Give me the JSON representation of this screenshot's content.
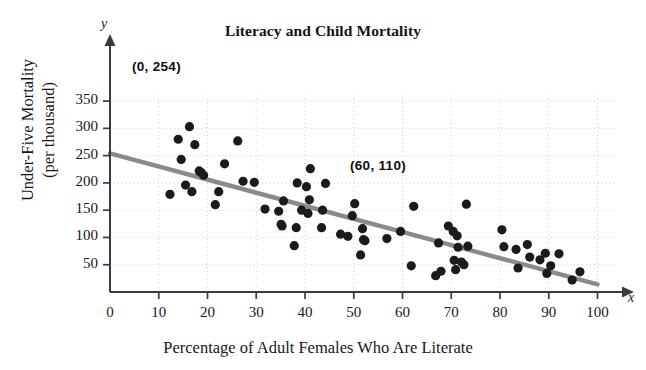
{
  "figure": {
    "top_partial_text": "",
    "x_axis_letter": "x",
    "y_axis_letter": "y"
  },
  "chart_data": {
    "type": "scatter",
    "title": "Literacy and Child Mortality",
    "xlabel": "Percentage of Adult Females Who Are Literate",
    "ylabel": "Under-Five Mortality",
    "ylabel_line2": "(per thousand)",
    "xlim": [
      0,
      104
    ],
    "ylim": [
      0,
      375
    ],
    "xticks": [
      0,
      10,
      20,
      30,
      40,
      50,
      60,
      70,
      80,
      90,
      100
    ],
    "yticks": [
      50,
      100,
      150,
      200,
      250,
      300,
      350
    ],
    "grid": true,
    "grid_style": "dotted",
    "legend": null,
    "colors": {
      "point": "#1a1a1f",
      "trendline": "#8a8a8e",
      "axis": "#3a3a40",
      "grid": "#c9c9cf",
      "text": "#17171b"
    },
    "point_radius": 4.6,
    "trendline": {
      "label": "least-squares line",
      "points": [
        [
          0,
          254
        ],
        [
          100,
          14
        ]
      ],
      "slope": -2.4,
      "intercept": 254,
      "annotated_points": [
        {
          "label": "(0, 254)",
          "x": 0,
          "y": 254
        },
        {
          "label": "(60, 110)",
          "x": 60,
          "y": 110
        }
      ]
    },
    "points": [
      [
        12.3,
        179
      ],
      [
        14.0,
        280
      ],
      [
        14.6,
        243
      ],
      [
        15.5,
        196
      ],
      [
        16.3,
        303
      ],
      [
        16.8,
        184
      ],
      [
        17.4,
        270
      ],
      [
        18.3,
        222
      ],
      [
        18.7,
        219
      ],
      [
        19.2,
        214
      ],
      [
        21.6,
        160
      ],
      [
        22.3,
        184
      ],
      [
        23.5,
        235
      ],
      [
        26.2,
        277
      ],
      [
        27.3,
        203
      ],
      [
        29.6,
        201
      ],
      [
        31.8,
        152
      ],
      [
        34.6,
        148
      ],
      [
        35.1,
        124
      ],
      [
        35.3,
        121
      ],
      [
        35.6,
        167
      ],
      [
        37.8,
        85
      ],
      [
        38.2,
        118
      ],
      [
        38.4,
        200
      ],
      [
        39.3,
        150
      ],
      [
        40.3,
        193
      ],
      [
        40.6,
        144
      ],
      [
        40.9,
        169
      ],
      [
        41.1,
        226
      ],
      [
        43.4,
        118
      ],
      [
        43.6,
        150
      ],
      [
        44.2,
        199
      ],
      [
        47.3,
        106
      ],
      [
        48.8,
        102
      ],
      [
        49.7,
        140
      ],
      [
        50.2,
        162
      ],
      [
        51.4,
        68
      ],
      [
        51.8,
        116
      ],
      [
        52.0,
        96
      ],
      [
        52.3,
        94
      ],
      [
        56.8,
        98
      ],
      [
        59.6,
        111
      ],
      [
        61.8,
        48
      ],
      [
        62.3,
        157
      ],
      [
        66.8,
        30
      ],
      [
        67.4,
        90
      ],
      [
        67.9,
        38
      ],
      [
        69.4,
        121
      ],
      [
        70.4,
        111
      ],
      [
        70.6,
        58
      ],
      [
        70.9,
        41
      ],
      [
        71.2,
        103
      ],
      [
        71.4,
        82
      ],
      [
        72.1,
        55
      ],
      [
        72.6,
        50
      ],
      [
        73.1,
        161
      ],
      [
        73.4,
        84
      ],
      [
        80.4,
        114
      ],
      [
        80.8,
        83
      ],
      [
        83.3,
        78
      ],
      [
        83.7,
        44
      ],
      [
        85.6,
        87
      ],
      [
        86.1,
        64
      ],
      [
        88.2,
        59
      ],
      [
        89.3,
        71
      ],
      [
        89.6,
        34
      ],
      [
        90.4,
        48
      ],
      [
        92.1,
        70
      ],
      [
        94.8,
        22
      ],
      [
        96.4,
        37
      ]
    ]
  }
}
